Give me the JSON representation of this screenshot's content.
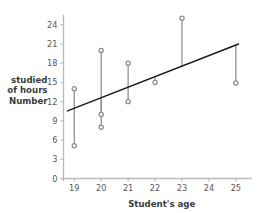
{
  "chart_data": {
    "type": "scatter",
    "title": "",
    "xlabel": "Student's age",
    "ylabel": "Number of hours studied",
    "ylabel_lines": [
      "Number",
      "of hours",
      "studied"
    ],
    "xlim": [
      18.6,
      25.6
    ],
    "ylim": [
      0,
      25.6
    ],
    "xticks": [
      19,
      20,
      21,
      22,
      23,
      24,
      25
    ],
    "yticks": [
      0,
      3,
      6,
      9,
      12,
      15,
      18,
      21,
      24
    ],
    "xtick_labels": [
      "19",
      "20",
      "21",
      "22",
      "23",
      "24",
      "25"
    ],
    "ytick_labels": [
      "0",
      "3",
      "6",
      "9",
      "12",
      "15",
      "18",
      "21",
      "24"
    ],
    "grid": false,
    "legend": "none",
    "points": [
      {
        "x": 19,
        "y": 14.0
      },
      {
        "x": 19,
        "y": 5.1
      },
      {
        "x": 20,
        "y": 20.0
      },
      {
        "x": 20,
        "y": 10.0
      },
      {
        "x": 20,
        "y": 8.0
      },
      {
        "x": 21,
        "y": 18.0
      },
      {
        "x": 21,
        "y": 12.0
      },
      {
        "x": 22,
        "y": 15.0
      },
      {
        "x": 23,
        "y": 25.0
      },
      {
        "x": 25,
        "y": 14.9
      }
    ],
    "residual_segments": [
      {
        "x": 19,
        "y_point": 14.0,
        "y_line": 10.7
      },
      {
        "x": 19,
        "y_point": 5.1,
        "y_line": 10.7
      },
      {
        "x": 20,
        "y_point": 20.0,
        "y_line": 12.4
      },
      {
        "x": 20,
        "y_point": 10.0,
        "y_line": 12.4
      },
      {
        "x": 20,
        "y_point": 8.0,
        "y_line": 12.4
      },
      {
        "x": 21,
        "y_point": 18.0,
        "y_line": 14.1
      },
      {
        "x": 21,
        "y_point": 12.0,
        "y_line": 14.1
      },
      {
        "x": 22,
        "y_point": 15.0,
        "y_line": 15.8
      },
      {
        "x": 23,
        "y_point": 25.0,
        "y_line": 17.5
      },
      {
        "x": 25,
        "y_point": 14.9,
        "y_line": 20.8
      }
    ],
    "trend_line": {
      "x_start": 18.75,
      "y_start": 10.55,
      "x_end": 25.1,
      "y_end": 21.0,
      "slope": 1.645,
      "intercept": -20.28,
      "color": "#1a1a1a"
    },
    "colors": {
      "point": "#8c8c8c",
      "residual": "#8c8c8c",
      "trend": "#1a1a1a",
      "axis": "#b9babb",
      "tick_text": "#58595b",
      "label_text": "#3b3b3d",
      "background": "#ffffff"
    }
  }
}
